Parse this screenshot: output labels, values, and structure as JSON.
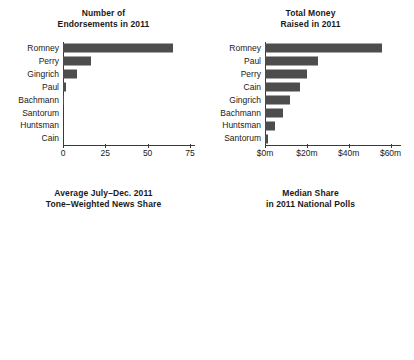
{
  "figure": {
    "width": 414,
    "height": 360,
    "background": "#ffffff",
    "bar_color": "#4d4d4d",
    "axis_color": "#3a3a3a",
    "text_color": "#1a1a1a"
  },
  "chart_data": [
    {
      "id": "endorsements",
      "type": "bar",
      "orientation": "horizontal",
      "title": "Number of\nEndorsements in 2011",
      "title_lines": [
        "Number of",
        "Endorsements in 2011"
      ],
      "xlabel": "",
      "ylabel": "",
      "categories": [
        "Romney",
        "Perry",
        "Gingrich",
        "Paul",
        "Bachmann",
        "Santorum",
        "Huntsman",
        "Cain"
      ],
      "values": [
        65,
        16.5,
        8.5,
        1.8,
        0.8,
        0,
        0,
        0
      ],
      "xlim": [
        0,
        78
      ],
      "xticks": [
        0,
        25,
        50,
        75
      ],
      "xticklabels": [
        "0",
        "25",
        "50",
        "75"
      ],
      "grid": false,
      "legend": false
    },
    {
      "id": "money-raised",
      "type": "bar",
      "orientation": "horizontal",
      "title": "Total Money\nRaised in 2011",
      "title_lines": [
        "Total Money",
        "Raised in 2011"
      ],
      "xlabel": "",
      "ylabel": "",
      "categories": [
        "Romney",
        "Paul",
        "Perry",
        "Cain",
        "Gingrich",
        "Bachmann",
        "Huntsman",
        "Santorum"
      ],
      "values": [
        56.0,
        25.5,
        20.0,
        16.5,
        12.0,
        8.5,
        5.0,
        1.5
      ],
      "xlim": [
        0,
        65
      ],
      "xticks": [
        0,
        20,
        40,
        60
      ],
      "xticklabels": [
        "$0m",
        "$20m",
        "$40m",
        "$60m"
      ],
      "grid": false,
      "legend": false
    },
    {
      "id": "news-share",
      "type": "bar",
      "orientation": "horizontal",
      "title": "Average July–Dec. 2011\nTone–Weighted News Share",
      "title_lines": [
        "Average July–Dec. 2011",
        "Tone–Weighted News Share"
      ],
      "xlabel": "",
      "ylabel": "",
      "categories": [
        "Romney",
        "Paul",
        "Perry",
        "Gingrich",
        "Huntsman",
        "Santorum",
        "Bachmann",
        "Cain"
      ],
      "values": [
        6.6,
        6.4,
        4.1,
        1.9,
        1.3,
        0.55,
        0.12,
        -1.6
      ],
      "xlim": [
        -2.6,
        8.6
      ],
      "xticks": [
        -2,
        0,
        2,
        4,
        6,
        8
      ],
      "xticklabels": [
        "−2",
        "0",
        "2",
        "4",
        "6",
        "8"
      ],
      "grid": false,
      "legend": false
    },
    {
      "id": "national-polls",
      "type": "bar",
      "orientation": "horizontal",
      "title": "Median Share\nin 2011 National Polls",
      "title_lines": [
        "Median Share",
        "in 2011 National Polls"
      ],
      "xlabel": "",
      "ylabel": "",
      "categories": [
        "Romney",
        "Cain",
        "Perry",
        "Gingrich",
        "Paul",
        "Santorum",
        "Huntsman"
      ],
      "values": [
        19.9,
        11.9,
        9.9,
        9.0,
        7.8,
        1.9,
        1.9
      ],
      "xlim": [
        0,
        21.5
      ],
      "xticks": [
        0,
        5,
        10,
        15,
        20
      ],
      "xticklabels": [
        "0%",
        "5%",
        "10%",
        "15%",
        "20%"
      ],
      "grid": false,
      "legend": false
    }
  ]
}
